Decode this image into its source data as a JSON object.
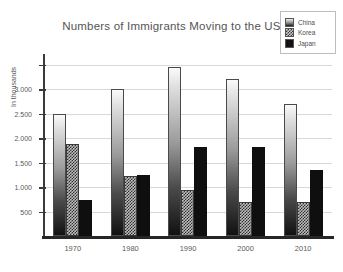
{
  "chart_data": {
    "type": "bar",
    "title": "Numbers of Immigrants Moving to the US",
    "xlabel": "",
    "ylabel": "In thousands",
    "categories": [
      "1970",
      "1980",
      "1990",
      "2000",
      "2010"
    ],
    "series": [
      {
        "name": "China",
        "values": [
          2500,
          3010,
          3450,
          3220,
          2710
        ],
        "swatch": "gradient-light-to-dark"
      },
      {
        "name": "Korea",
        "values": [
          1880,
          1230,
          950,
          690,
          690
        ],
        "swatch": "checkerboard"
      },
      {
        "name": "Japan",
        "values": [
          740,
          1240,
          1820,
          1820,
          1350
        ],
        "swatch": "solid-black"
      }
    ],
    "ytick_labels": [
      "500",
      "1.000",
      "1.500",
      "2.000",
      "2.500",
      "3.000"
    ],
    "ytick_values": [
      500,
      1000,
      1500,
      2000,
      2500,
      3000
    ],
    "ylim": [
      0,
      3600
    ],
    "grid": true,
    "legend_position": "top-right",
    "colors": {
      "grid": "#d8d8d8",
      "axis": "#3a3a3a",
      "text": "#5a5a5a",
      "china": "#9a9a9a",
      "korea": "#bdbdbd",
      "japan": "#0f0f0f",
      "background": "#ffffff"
    }
  }
}
